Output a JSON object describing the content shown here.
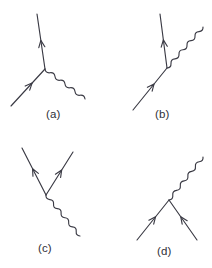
{
  "figure": {
    "type": "feynman-diagrams",
    "background_color": "#ffffff",
    "line_color": "#3a3a44",
    "label_color": "#2f2f38",
    "width": 212,
    "height": 268,
    "panel_count": 4
  },
  "panels": [
    {
      "id": "a",
      "label": "(a)",
      "label_x": 46,
      "label_y": 108,
      "vertex": {
        "x": 45,
        "y": 69
      },
      "description": "electron absorbs/emits photon: incoming fermion from lower-left, outgoing fermion upward, photon to lower-right",
      "fermions": [
        {
          "name": "incoming-fermion",
          "from": {
            "x": 11,
            "y": 106
          },
          "to": {
            "x": 45,
            "y": 69
          },
          "arrow_direction": "toward-vertex",
          "arrow_at": 0.62
        },
        {
          "name": "outgoing-fermion",
          "from": {
            "x": 45,
            "y": 69
          },
          "to": {
            "x": 37,
            "y": 14
          },
          "arrow_direction": "away-from-vertex",
          "arrow_at": 0.52
        }
      ],
      "photons": [
        {
          "name": "photon",
          "from": {
            "x": 45,
            "y": 69
          },
          "to": {
            "x": 85,
            "y": 99
          },
          "wavelength": 6.0,
          "amplitude": 3.0
        }
      ]
    },
    {
      "id": "b",
      "label": "(b)",
      "label_x": 155,
      "label_y": 108,
      "vertex": {
        "x": 167,
        "y": 68
      },
      "description": "incoming fermion from lower-left, outgoing fermion upward, photon emitted to upper-right",
      "fermions": [
        {
          "name": "incoming-fermion",
          "from": {
            "x": 133,
            "y": 110
          },
          "to": {
            "x": 167,
            "y": 68
          },
          "arrow_direction": "toward-vertex",
          "arrow_at": 0.62
        },
        {
          "name": "outgoing-fermion",
          "from": {
            "x": 167,
            "y": 68
          },
          "to": {
            "x": 160,
            "y": 14
          },
          "arrow_direction": "away-from-vertex",
          "arrow_at": 0.52
        }
      ],
      "photons": [
        {
          "name": "photon",
          "from": {
            "x": 167,
            "y": 68
          },
          "to": {
            "x": 203,
            "y": 27
          },
          "wavelength": 6.0,
          "amplitude": 3.0
        }
      ]
    },
    {
      "id": "c",
      "label": "(c)",
      "label_x": 38,
      "label_y": 242,
      "vertex": {
        "x": 46,
        "y": 195
      },
      "description": "pair production: photon from lower-right, two outgoing fermion lines to upper-left and upper-right",
      "fermions": [
        {
          "name": "outgoing-fermion-left",
          "from": {
            "x": 46,
            "y": 195
          },
          "to": {
            "x": 22,
            "y": 148
          },
          "arrow_direction": "away-from-vertex",
          "arrow_at": 0.56
        },
        {
          "name": "outgoing-fermion-right",
          "from": {
            "x": 46,
            "y": 195
          },
          "to": {
            "x": 73,
            "y": 152
          },
          "arrow_direction": "away-from-vertex",
          "arrow_at": 0.58
        }
      ],
      "photons": [
        {
          "name": "photon",
          "from": {
            "x": 46,
            "y": 195
          },
          "to": {
            "x": 80,
            "y": 236
          },
          "wavelength": 6.0,
          "amplitude": 3.0
        }
      ]
    },
    {
      "id": "d",
      "label": "(d)",
      "label_x": 157,
      "label_y": 245,
      "vertex": {
        "x": 169,
        "y": 200
      },
      "description": "pair annihilation: two incoming fermion lines from below, photon emitted to upper-right",
      "fermions": [
        {
          "name": "incoming-fermion-left",
          "from": {
            "x": 137,
            "y": 240
          },
          "to": {
            "x": 169,
            "y": 200
          },
          "arrow_direction": "toward-vertex",
          "arrow_at": 0.58
        },
        {
          "name": "incoming-fermion-right",
          "from": {
            "x": 197,
            "y": 240
          },
          "to": {
            "x": 169,
            "y": 200
          },
          "arrow_direction": "toward-vertex",
          "arrow_at": 0.58
        }
      ],
      "photons": [
        {
          "name": "photon",
          "from": {
            "x": 169,
            "y": 200
          },
          "to": {
            "x": 203,
            "y": 157
          },
          "wavelength": 6.0,
          "amplitude": 3.0
        }
      ]
    }
  ]
}
